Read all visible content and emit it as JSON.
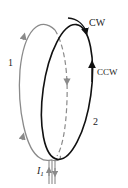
{
  "diagram": {
    "loop1": {
      "label": "1",
      "color": "#8a8a8a"
    },
    "loop2": {
      "label": "2",
      "color": "#111111"
    },
    "cw_label": "CW",
    "ccw_label": "CCW",
    "current_label": "I",
    "current_subscript": "1"
  }
}
